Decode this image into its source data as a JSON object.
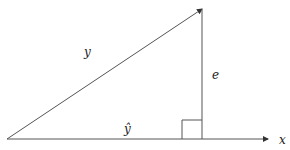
{
  "diagram": {
    "type": "vector-projection",
    "labels": {
      "hypotenuse": "y",
      "projection": "ŷ",
      "residual": "e",
      "axis": "x"
    },
    "colors": {
      "stroke": "#333333",
      "background": "#ffffff"
    }
  }
}
